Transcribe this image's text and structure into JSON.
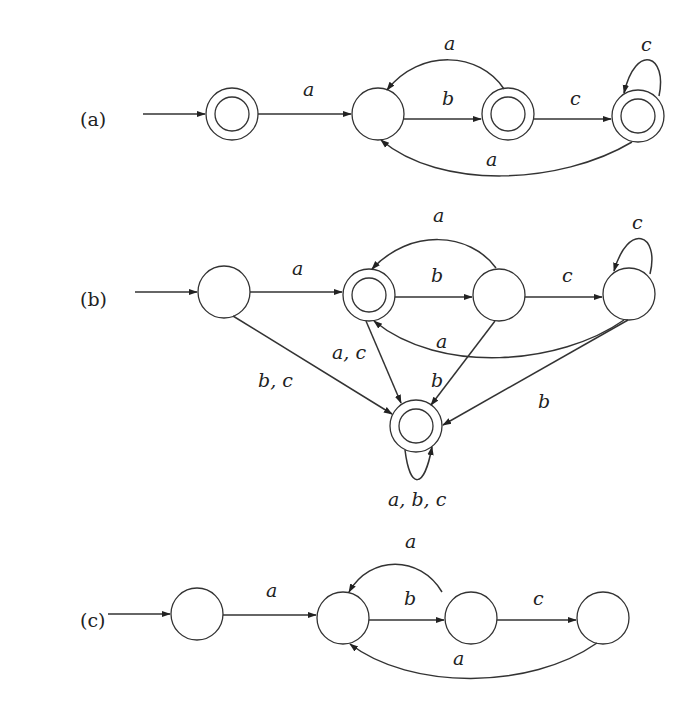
{
  "diagrams": [
    {
      "id": "a",
      "panel_label": "(a)",
      "states": [
        {
          "id": "q0",
          "accepting": true,
          "initial": true
        },
        {
          "id": "q1",
          "accepting": false
        },
        {
          "id": "q2",
          "accepting": true
        },
        {
          "id": "q3",
          "accepting": true
        }
      ],
      "transitions": [
        {
          "from": "q0",
          "to": "q1",
          "label": "a"
        },
        {
          "from": "q1",
          "to": "q2",
          "label": "b"
        },
        {
          "from": "q2",
          "to": "q1",
          "label": "a"
        },
        {
          "from": "q2",
          "to": "q3",
          "label": "c"
        },
        {
          "from": "q3",
          "to": "q3",
          "label": "c"
        },
        {
          "from": "q3",
          "to": "q1",
          "label": "a"
        }
      ]
    },
    {
      "id": "b",
      "panel_label": "(b)",
      "states": [
        {
          "id": "q0",
          "accepting": false,
          "initial": true
        },
        {
          "id": "q1",
          "accepting": true
        },
        {
          "id": "q2",
          "accepting": false
        },
        {
          "id": "q3",
          "accepting": false
        },
        {
          "id": "q4",
          "accepting": true
        }
      ],
      "transitions": [
        {
          "from": "q0",
          "to": "q1",
          "label": "a"
        },
        {
          "from": "q0",
          "to": "q4",
          "label": "b, c"
        },
        {
          "from": "q1",
          "to": "q2",
          "label": "b"
        },
        {
          "from": "q1",
          "to": "q4",
          "label": "a, c"
        },
        {
          "from": "q2",
          "to": "q1",
          "label": "a"
        },
        {
          "from": "q2",
          "to": "q3",
          "label": "c"
        },
        {
          "from": "q2",
          "to": "q4",
          "label": "b"
        },
        {
          "from": "q3",
          "to": "q3",
          "label": "c"
        },
        {
          "from": "q3",
          "to": "q1",
          "label": "a"
        },
        {
          "from": "q3",
          "to": "q4",
          "label": "b"
        },
        {
          "from": "q4",
          "to": "q4",
          "label": "a, b, c"
        }
      ]
    },
    {
      "id": "c",
      "panel_label": "(c)",
      "states": [
        {
          "id": "q0",
          "accepting": false,
          "initial": true
        },
        {
          "id": "q1",
          "accepting": false
        },
        {
          "id": "q2",
          "accepting": false
        },
        {
          "id": "q3",
          "accepting": false
        }
      ],
      "transitions": [
        {
          "from": "q0",
          "to": "q1",
          "label": "a"
        },
        {
          "from": "q1",
          "to": "q2",
          "label": "b"
        },
        {
          "from": "q2",
          "to": "q1",
          "label": "a"
        },
        {
          "from": "q2",
          "to": "q3",
          "label": "c"
        },
        {
          "from": "q3",
          "to": "q1",
          "label": "a"
        }
      ]
    }
  ],
  "labels": {
    "a": {
      "panel": "(a)",
      "q0_q1": "a",
      "q1_q2": "b",
      "q2_q1": "a",
      "q2_q3": "c",
      "q3_q3": "c",
      "q3_q1": "a"
    },
    "b": {
      "panel": "(b)",
      "q0_q1": "a",
      "q0_q4": "b, c",
      "q1_q2": "b",
      "q1_q4": "a, c",
      "q2_q1": "a",
      "q2_q3": "c",
      "q2_q4": "b",
      "q3_q3": "c",
      "q3_q1": "a",
      "q3_q4": "b",
      "q4_q4": "a, b, c"
    },
    "c": {
      "panel": "(c)",
      "q0_q1": "a",
      "q1_q2": "b",
      "q2_q1": "a",
      "q2_q3": "c",
      "q3_q1": "a"
    }
  }
}
